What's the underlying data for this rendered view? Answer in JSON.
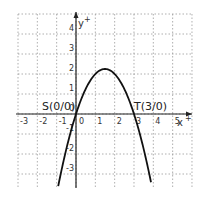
{
  "chart_data": {
    "type": "line",
    "title": "",
    "function": "f(x) = -x^2 + 3x",
    "xlabel": "x",
    "ylabel": "y",
    "xlim": [
      -3,
      6
    ],
    "ylim": [
      -3.65,
      5
    ],
    "grid": true,
    "x_ticks": [
      "-3",
      "-2",
      "-1",
      "0",
      "1",
      "2",
      "3",
      "4",
      "5"
    ],
    "y_ticks": [
      "4",
      "3",
      "2",
      "1",
      "-1",
      "-2",
      "-3"
    ],
    "series": [
      {
        "name": "parabola",
        "x": [
          -0.9,
          -0.5,
          0,
          0.5,
          1,
          1.5,
          2,
          2.5,
          3,
          3.5,
          3.9
        ],
        "values": [
          -3.51,
          -1.75,
          0,
          1.25,
          2,
          2.25,
          2,
          1.25,
          0,
          -1.75,
          -3.51
        ]
      }
    ],
    "annotations": [
      {
        "label": "S(0/0)",
        "x": 0,
        "y": 0
      },
      {
        "label": "T(3/0)",
        "x": 3,
        "y": 0
      }
    ],
    "origin_label": "0"
  }
}
